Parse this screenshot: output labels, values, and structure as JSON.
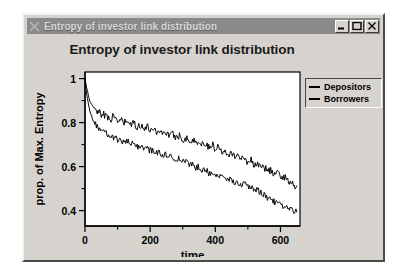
{
  "window": {
    "title": "Entropy of investor link distribution",
    "menu_icon": "window-menu-x-icon",
    "controls": {
      "minimize": "minimize-icon",
      "maximize": "maximize-icon",
      "close": "close-icon"
    }
  },
  "chart_data": {
    "type": "line",
    "title": "Entropy of investor link distribution",
    "xlabel": "time",
    "ylabel": "prop. of Max. Entropy",
    "xlim": [
      0,
      660
    ],
    "ylim": [
      0.33,
      1.03
    ],
    "xticks": [
      0,
      200,
      400,
      600
    ],
    "xtick_labels": [
      "0",
      "200",
      "400",
      "600"
    ],
    "xminor_ticks": [
      100,
      300,
      500
    ],
    "yticks": [
      0.4,
      0.6,
      0.8,
      1.0
    ],
    "ytick_labels": [
      "0.4",
      "0.6",
      "0.8",
      "1"
    ],
    "yminor_ticks": [
      0.5,
      0.7,
      0.9
    ],
    "grid": false,
    "legend_position": "outside-right-top",
    "series": [
      {
        "name": "Depositors",
        "color": "#000000",
        "x": [
          0,
          5,
          10,
          15,
          20,
          25,
          30,
          35,
          40,
          45,
          50,
          55,
          60,
          65,
          70,
          75,
          80,
          85,
          90,
          95,
          100,
          110,
          120,
          130,
          140,
          150,
          160,
          170,
          180,
          190,
          200,
          210,
          220,
          230,
          240,
          250,
          260,
          270,
          280,
          290,
          300,
          310,
          320,
          330,
          340,
          350,
          360,
          370,
          380,
          390,
          400,
          410,
          420,
          430,
          440,
          450,
          460,
          470,
          480,
          490,
          500,
          510,
          520,
          530,
          540,
          550,
          560,
          570,
          580,
          590,
          600,
          610,
          620,
          630,
          640,
          650
        ],
        "y": [
          1.0,
          0.955,
          0.93,
          0.895,
          0.885,
          0.872,
          0.858,
          0.868,
          0.845,
          0.855,
          0.838,
          0.846,
          0.828,
          0.838,
          0.822,
          0.83,
          0.818,
          0.826,
          0.812,
          0.818,
          0.806,
          0.812,
          0.798,
          0.806,
          0.79,
          0.796,
          0.782,
          0.79,
          0.774,
          0.782,
          0.768,
          0.776,
          0.758,
          0.766,
          0.748,
          0.758,
          0.74,
          0.748,
          0.732,
          0.742,
          0.724,
          0.73,
          0.716,
          0.72,
          0.71,
          0.714,
          0.7,
          0.708,
          0.69,
          0.7,
          0.682,
          0.69,
          0.67,
          0.678,
          0.658,
          0.67,
          0.646,
          0.652,
          0.634,
          0.64,
          0.622,
          0.63,
          0.608,
          0.616,
          0.594,
          0.6,
          0.578,
          0.585,
          0.566,
          0.572,
          0.552,
          0.558,
          0.54,
          0.53,
          0.518,
          0.512
        ]
      },
      {
        "name": "Borrowers",
        "color": "#000000",
        "x": [
          0,
          5,
          10,
          15,
          20,
          25,
          30,
          35,
          40,
          45,
          50,
          55,
          60,
          65,
          70,
          75,
          80,
          85,
          90,
          95,
          100,
          110,
          120,
          130,
          140,
          150,
          160,
          170,
          180,
          190,
          200,
          210,
          220,
          230,
          240,
          250,
          260,
          270,
          280,
          290,
          300,
          310,
          320,
          330,
          340,
          350,
          360,
          370,
          380,
          390,
          400,
          410,
          420,
          430,
          440,
          450,
          460,
          470,
          480,
          490,
          500,
          510,
          520,
          530,
          540,
          550,
          560,
          570,
          580,
          590,
          600,
          610,
          620,
          630,
          640,
          650
        ],
        "y": [
          1.0,
          0.93,
          0.885,
          0.85,
          0.832,
          0.81,
          0.8,
          0.786,
          0.776,
          0.768,
          0.756,
          0.762,
          0.748,
          0.754,
          0.74,
          0.746,
          0.734,
          0.738,
          0.726,
          0.73,
          0.718,
          0.722,
          0.708,
          0.714,
          0.7,
          0.704,
          0.69,
          0.696,
          0.68,
          0.686,
          0.672,
          0.676,
          0.662,
          0.666,
          0.652,
          0.656,
          0.642,
          0.646,
          0.632,
          0.636,
          0.62,
          0.624,
          0.608,
          0.612,
          0.596,
          0.6,
          0.584,
          0.588,
          0.572,
          0.576,
          0.56,
          0.562,
          0.548,
          0.55,
          0.538,
          0.54,
          0.528,
          0.53,
          0.518,
          0.52,
          0.508,
          0.506,
          0.496,
          0.492,
          0.48,
          0.472,
          0.46,
          0.452,
          0.442,
          0.434,
          0.424,
          0.418,
          0.41,
          0.404,
          0.398,
          0.394
        ]
      }
    ],
    "legend": [
      {
        "label": "Depositors"
      },
      {
        "label": "Borrowers"
      }
    ]
  }
}
